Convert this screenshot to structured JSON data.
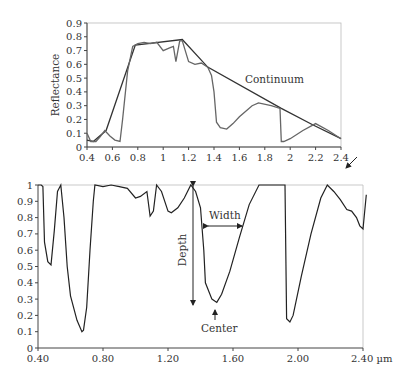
{
  "chart_data": [
    {
      "type": "line",
      "title": "",
      "xlabel": "",
      "ylabel": "Reflectance",
      "xlim": [
        0.4,
        2.4
      ],
      "ylim": [
        0,
        0.9
      ],
      "x_ticks": [
        "0.4",
        "0.6",
        "0.8",
        "1",
        "1.2",
        "1.4",
        "1.6",
        "1.8",
        "2",
        "2.2",
        "2.4"
      ],
      "y_ticks": [
        "0",
        "0.1",
        "0.2",
        "0.3",
        "0.4",
        "0.5",
        "0.6",
        "0.7",
        "0.8",
        "0.9"
      ],
      "grid": false,
      "annotations": [
        "Continuum"
      ],
      "series": [
        {
          "name": "Reflectance spectrum",
          "x": [
            0.4,
            0.43,
            0.47,
            0.5,
            0.54,
            0.58,
            0.62,
            0.66,
            0.68,
            0.72,
            0.76,
            0.8,
            0.85,
            0.9,
            0.95,
            1.0,
            1.05,
            1.08,
            1.1,
            1.13,
            1.15,
            1.2,
            1.25,
            1.3,
            1.35,
            1.38,
            1.4,
            1.42,
            1.45,
            1.5,
            1.55,
            1.6,
            1.7,
            1.75,
            1.85,
            1.92,
            1.93,
            1.95,
            2.0,
            2.1,
            2.2,
            2.3,
            2.4
          ],
          "y": [
            0.1,
            0.04,
            0.04,
            0.07,
            0.12,
            0.08,
            0.05,
            0.04,
            0.2,
            0.55,
            0.73,
            0.75,
            0.76,
            0.75,
            0.76,
            0.7,
            0.72,
            0.73,
            0.62,
            0.77,
            0.77,
            0.62,
            0.6,
            0.61,
            0.58,
            0.52,
            0.4,
            0.18,
            0.14,
            0.13,
            0.17,
            0.22,
            0.3,
            0.32,
            0.3,
            0.28,
            0.04,
            0.04,
            0.06,
            0.12,
            0.17,
            0.12,
            0.06
          ]
        },
        {
          "name": "Continuum",
          "x": [
            0.4,
            0.45,
            0.55,
            0.78,
            1.15,
            1.35,
            1.93,
            2.18,
            2.4
          ],
          "y": [
            0.05,
            0.04,
            0.12,
            0.74,
            0.78,
            0.58,
            0.28,
            0.16,
            0.06
          ]
        }
      ]
    },
    {
      "type": "line",
      "title": "",
      "xlabel": "µm",
      "ylabel": "",
      "xlim": [
        0.4,
        2.4
      ],
      "ylim": [
        0,
        1
      ],
      "x_ticks": [
        "0.40",
        "0.80",
        "1.20",
        "1.60",
        "2.00",
        "2.40 µm"
      ],
      "y_ticks": [
        "0",
        "0.1",
        "0.2",
        "0.3",
        "0.4",
        "0.5",
        "0.6",
        "0.7",
        "0.8",
        "0.9",
        "1"
      ],
      "grid": false,
      "annotations": [
        "Depth",
        "Width",
        "Center"
      ],
      "series": [
        {
          "name": "Continuum-removed spectrum",
          "x": [
            0.4,
            0.42,
            0.43,
            0.44,
            0.46,
            0.48,
            0.5,
            0.52,
            0.54,
            0.56,
            0.58,
            0.6,
            0.64,
            0.67,
            0.68,
            0.7,
            0.72,
            0.74,
            0.75,
            0.8,
            0.85,
            0.9,
            0.95,
            1.0,
            1.03,
            1.07,
            1.09,
            1.11,
            1.13,
            1.16,
            1.2,
            1.22,
            1.26,
            1.3,
            1.34,
            1.37,
            1.4,
            1.42,
            1.43,
            1.47,
            1.5,
            1.53,
            1.58,
            1.64,
            1.7,
            1.76,
            1.92,
            1.93,
            1.95,
            1.97,
            2.02,
            2.08,
            2.14,
            2.18,
            2.22,
            2.26,
            2.3,
            2.33,
            2.36,
            2.38,
            2.4,
            2.42
          ],
          "y": [
            1.0,
            1.0,
            0.99,
            0.65,
            0.53,
            0.51,
            0.72,
            0.96,
            1.0,
            0.8,
            0.5,
            0.32,
            0.17,
            0.1,
            0.11,
            0.25,
            0.6,
            0.9,
            1.0,
            0.99,
            1.0,
            0.99,
            0.98,
            0.92,
            0.93,
            0.96,
            0.81,
            0.84,
            1.0,
            0.96,
            0.84,
            0.83,
            0.86,
            0.92,
            1.0,
            0.96,
            0.86,
            0.6,
            0.4,
            0.3,
            0.28,
            0.33,
            0.47,
            0.68,
            0.88,
            1.0,
            1.0,
            0.18,
            0.16,
            0.2,
            0.44,
            0.7,
            0.92,
            1.0,
            0.96,
            0.91,
            0.85,
            0.84,
            0.8,
            0.75,
            0.73,
            0.94
          ]
        }
      ]
    }
  ],
  "top_chart": {
    "ylabel": "Reflectance",
    "continuum_label": "Continuum",
    "x_ticks": [
      "0.4",
      "0.6",
      "0.8",
      "1",
      "1.2",
      "1.4",
      "1.6",
      "1.8",
      "2",
      "2.2",
      "2.4"
    ],
    "y_ticks": [
      "0",
      "0.1",
      "0.2",
      "0.3",
      "0.4",
      "0.5",
      "0.6",
      "0.7",
      "0.8",
      "0.9"
    ]
  },
  "bottom_chart": {
    "x_ticks": [
      "0.40",
      "0.80",
      "1.20",
      "1.60",
      "2.00",
      "2.40 µm"
    ],
    "y_ticks": [
      "0",
      "0.1",
      "0.2",
      "0.3",
      "0.4",
      "0.5",
      "0.6",
      "0.7",
      "0.8",
      "0.9",
      "1"
    ],
    "depth_label": "Depth",
    "width_label": "Width",
    "center_label": "Center"
  }
}
